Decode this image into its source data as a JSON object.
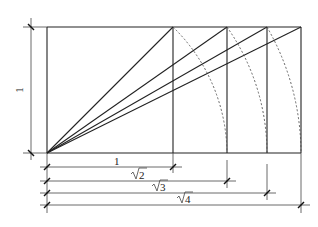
{
  "diagram": {
    "height_label": "1",
    "dimensions": [
      {
        "label": "1",
        "radical": false
      },
      {
        "label": "2",
        "radical": true
      },
      {
        "label": "3",
        "radical": true
      },
      {
        "label": "4",
        "radical": true
      }
    ],
    "colors": {
      "line": "#222222",
      "dash": "#555555",
      "background": "#ffffff"
    }
  }
}
